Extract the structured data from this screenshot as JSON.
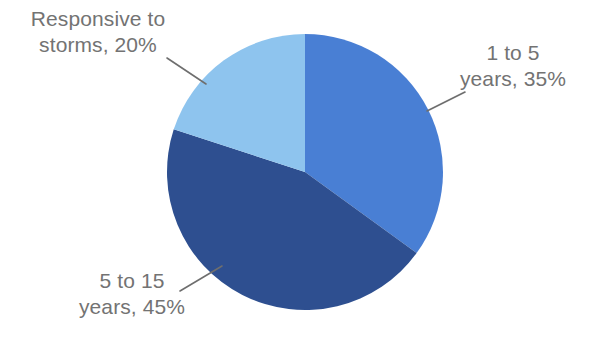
{
  "chart_data": {
    "type": "pie",
    "title": "",
    "subtitle": "",
    "xlabel": "",
    "ylabel": "",
    "legend_position": "none",
    "grid": false,
    "start_angle_deg": 0,
    "direction": "clockwise",
    "categories": [
      "1 to 5 years",
      "5 to 15 years",
      "Responsive to storms"
    ],
    "values": [
      35,
      45,
      20
    ],
    "value_unit": "%",
    "colors": [
      "#4a7fd4",
      "#2e5090",
      "#8ec4ee"
    ],
    "slices": [
      {
        "name": "1 to 5 years",
        "value": 35,
        "label": "1 to 5\nyears, 35%",
        "color": "#4a7fd4",
        "start_deg": 0,
        "end_deg": 126
      },
      {
        "name": "5 to 15 years",
        "value": 45,
        "label": "5 to 15\nyears, 45%",
        "color": "#2e5090",
        "start_deg": 126,
        "end_deg": 288
      },
      {
        "name": "Responsive to storms",
        "value": 20,
        "label": "Responsive to\nstorms, 20%",
        "color": "#8ec4ee",
        "start_deg": 288,
        "end_deg": 360
      }
    ]
  },
  "labels": {
    "responsive_to_storms": "Responsive to\nstorms, 20%",
    "one_to_five_years": "1 to 5\nyears, 35%",
    "five_to_fifteen_years": "5 to 15\nyears, 45%"
  },
  "style": {
    "background_color": "#ffffff",
    "label_text_color": "#737373",
    "leader_line_color": "#6e6e6e"
  }
}
